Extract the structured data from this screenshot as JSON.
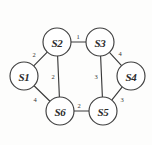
{
  "figure": {
    "kind": "weighted-undirected-graph",
    "background_color": "#fdfdfc",
    "node_fill": "#ffffff",
    "stroke_color": "#3a3a3a"
  },
  "nodes": [
    {
      "id": "S1",
      "label": "S1",
      "cx": 24,
      "cy": 76,
      "r": 14
    },
    {
      "id": "S2",
      "label": "S2",
      "cx": 57,
      "cy": 42,
      "r": 14
    },
    {
      "id": "S3",
      "label": "S3",
      "cx": 100,
      "cy": 42,
      "r": 14
    },
    {
      "id": "S4",
      "label": "S4",
      "cx": 131,
      "cy": 76,
      "r": 14
    },
    {
      "id": "S5",
      "label": "S5",
      "cx": 103,
      "cy": 111,
      "r": 14
    },
    {
      "id": "S6",
      "label": "S6",
      "cx": 60,
      "cy": 111,
      "r": 14
    }
  ],
  "edges": [
    {
      "from": "S1",
      "to": "S2",
      "weight": "2",
      "lx": 34,
      "ly": 54
    },
    {
      "from": "S2",
      "to": "S3",
      "weight": "1",
      "lx": 78,
      "ly": 36
    },
    {
      "from": "S3",
      "to": "S4",
      "weight": "4",
      "lx": 120,
      "ly": 53
    },
    {
      "from": "S4",
      "to": "S5",
      "weight": "3",
      "lx": 122,
      "ly": 99
    },
    {
      "from": "S6",
      "to": "S5",
      "weight": "2",
      "lx": 79,
      "ly": 105
    },
    {
      "from": "S1",
      "to": "S6",
      "weight": "4",
      "lx": 35,
      "ly": 99
    },
    {
      "from": "S2",
      "to": "S6",
      "weight": "2",
      "lx": 53,
      "ly": 76
    },
    {
      "from": "S3",
      "to": "S5",
      "weight": "3",
      "lx": 96,
      "ly": 76
    }
  ]
}
